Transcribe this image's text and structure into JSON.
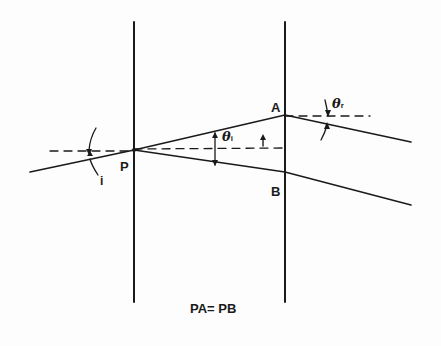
{
  "diagram": {
    "type": "optics ray diagram (beam splitting through a slab)",
    "labels": {
      "P": "P",
      "A": "A",
      "B": "B",
      "incidence_angle": "i",
      "theta_inner_symbol": "θ",
      "theta_inner_sub": "i",
      "theta_outer_symbol": "θ",
      "theta_outer_sub": "r",
      "thickness_marker": "t",
      "caption": "PA= PB"
    },
    "colors": {
      "ink": "#1a1a1a",
      "background": "#fdfdfd"
    },
    "points": {
      "P": [
        134,
        150
      ],
      "A": [
        285,
        115
      ],
      "B": [
        285,
        172
      ]
    },
    "boundaries": [
      {
        "name": "left-boundary",
        "x": 134,
        "y1": 22,
        "y2": 302
      },
      {
        "name": "right-boundary",
        "x": 285,
        "y1": 22,
        "y2": 302
      }
    ]
  }
}
